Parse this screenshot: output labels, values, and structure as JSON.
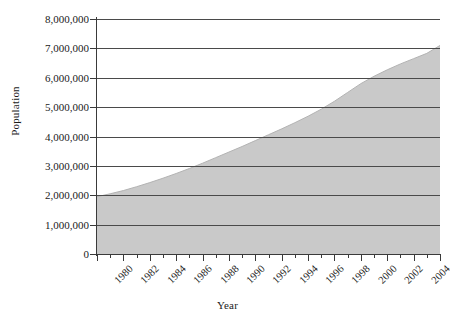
{
  "chart_data": {
    "type": "area",
    "title": "",
    "xlabel": "Year",
    "ylabel": "Population",
    "xlim": [
      1980,
      2006
    ],
    "ylim": [
      0,
      8000000
    ],
    "grid": true,
    "legend": false,
    "fill_color": "#c9c9c9",
    "line_color": "#b3b3b3",
    "grid_color": "#4a4a4a",
    "axis_color": "#3a3a3a",
    "ytick_labels": [
      "0",
      "1,000,000",
      "2,000,000",
      "3,000,000",
      "4,000,000",
      "5,000,000",
      "6,000,000",
      "7,000,000",
      "8,000,000"
    ],
    "ytick_values": [
      0,
      1000000,
      2000000,
      3000000,
      4000000,
      5000000,
      6000000,
      7000000,
      8000000
    ],
    "xtick_labels": [
      "1980",
      "1982",
      "1984",
      "1986",
      "1988",
      "1990",
      "1992",
      "1994",
      "1996",
      "1998",
      "2000",
      "2002",
      "2004",
      "2006"
    ],
    "xtick_values": [
      1980,
      1982,
      1984,
      1986,
      1988,
      1990,
      1992,
      1994,
      1996,
      1998,
      2000,
      2002,
      2004,
      2006
    ],
    "xtick_minor_values": [
      1981,
      1983,
      1985,
      1987,
      1989,
      1991,
      1993,
      1995,
      1997,
      1999,
      2001,
      2003,
      2005
    ],
    "x": [
      1980,
      1981,
      1982,
      1983,
      1984,
      1985,
      1986,
      1987,
      1988,
      1989,
      1990,
      1991,
      1992,
      1993,
      1994,
      1995,
      1996,
      1997,
      1998,
      1999,
      2000,
      2001,
      2002,
      2003,
      2004,
      2005,
      2006
    ],
    "values": [
      1950000,
      2050000,
      2160000,
      2290000,
      2430000,
      2580000,
      2740000,
      2910000,
      3090000,
      3280000,
      3470000,
      3660000,
      3860000,
      4060000,
      4260000,
      4470000,
      4690000,
      4930000,
      5200000,
      5500000,
      5800000,
      6050000,
      6270000,
      6470000,
      6650000,
      6830000,
      7100000
    ]
  }
}
